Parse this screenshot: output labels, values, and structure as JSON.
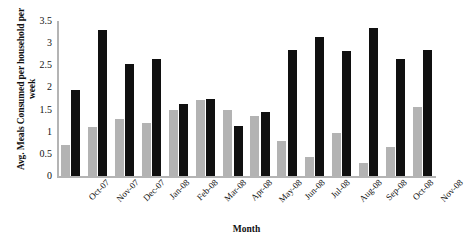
{
  "chart_data": {
    "type": "bar",
    "title": "",
    "xlabel": "Month",
    "ylabel": "Avg. Meals Consumed per household per week",
    "ylim": [
      0,
      3.5
    ],
    "yticks": [
      "0",
      "0.5",
      "1",
      "1.5",
      "2",
      "2.5",
      "3",
      "3.5"
    ],
    "ytick_values": [
      0,
      0.5,
      1,
      1.5,
      2,
      2.5,
      3,
      3.5
    ],
    "grid": false,
    "legend": "none",
    "categories": [
      "Oct-07",
      "Nov-07",
      "Dec-07",
      "Jan-08",
      "Feb-08",
      "Mar-08",
      "Apr-08",
      "May-08",
      "Jun-08",
      "Jul-08",
      "Aug-08",
      "Sep-08",
      "Oct-08",
      "Nov-08"
    ],
    "series": [
      {
        "name": "series-gray",
        "color": "#b3b3b3",
        "values": [
          0.7,
          1.1,
          1.28,
          1.2,
          1.5,
          1.72,
          1.48,
          1.35,
          0.78,
          0.42,
          0.98,
          0.3,
          0.65,
          1.55
        ]
      },
      {
        "name": "series-black",
        "color": "#101010",
        "values": [
          1.95,
          3.3,
          2.52,
          2.65,
          1.62,
          1.75,
          1.12,
          1.45,
          2.85,
          3.15,
          2.82,
          3.35,
          2.65,
          2.85
        ]
      }
    ]
  },
  "axis_colors": {
    "axis_line": "#b4b4b4",
    "text": "#111111"
  }
}
